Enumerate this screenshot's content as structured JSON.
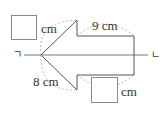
{
  "figure": {
    "axis": {
      "start_label": "ㄱ",
      "end_label": "ㄴ"
    },
    "labels": {
      "top_left_unit": "cm",
      "top_right_length": "9 cm",
      "bottom_left_length": "8 cm",
      "bottom_right_unit": "cm"
    },
    "blanks": [
      {
        "position": "top-left",
        "unit": "cm"
      },
      {
        "position": "bottom-right",
        "unit": "cm"
      }
    ],
    "colors": {
      "outline": "#555555",
      "axis": "#777777",
      "dashed_arc": "#aaaaaa",
      "text": "#333333"
    }
  }
}
